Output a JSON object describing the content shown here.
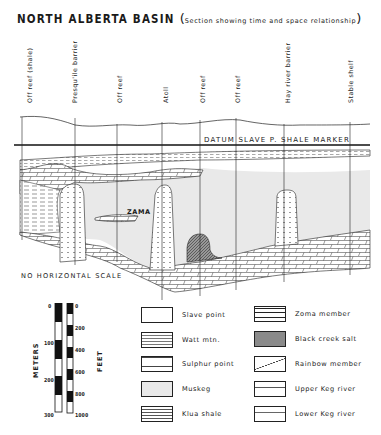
{
  "title": {
    "main": "NORTH  ALBERTA  BASIN",
    "subtitle": "Section  showing  time  and  space  relationship",
    "open_paren": "(",
    "close_paren": ")"
  },
  "wells": [
    {
      "label": "Off  reef  (shale)",
      "x": 30
    },
    {
      "label": "Presqu'ile  barrier",
      "x": 75
    },
    {
      "label": "Off  reef",
      "x": 120
    },
    {
      "label": "Atoll",
      "x": 165
    },
    {
      "label": "Off  reef",
      "x": 203
    },
    {
      "label": "Off  reef",
      "x": 238
    },
    {
      "label": "Hay  river  barrier",
      "x": 287
    },
    {
      "label": "Stable  shelf",
      "x": 350
    }
  ],
  "section": {
    "datum_label": "DATUM  SLAVE  P.  SHALE  MARKER",
    "zama_label": "ZAMA",
    "no_scale_label": "NO  HORIZONTAL  SCALE"
  },
  "scale_bar": {
    "meters_title": "METERS",
    "feet_title": "FEET",
    "meters_ticks": [
      "0",
      "100",
      "200",
      "300"
    ],
    "feet_ticks": [
      "0",
      "200",
      "400",
      "600",
      "800",
      "1000"
    ]
  },
  "legend": {
    "left": [
      {
        "label": "Slave  point",
        "pattern": "blank"
      },
      {
        "label": "Watt  mtn.",
        "pattern": "dashed"
      },
      {
        "label": "Sulphur  point",
        "pattern": "limestone"
      },
      {
        "label": "Muskeg",
        "pattern": "gray"
      },
      {
        "label": "Klua  shale",
        "pattern": "shale"
      }
    ],
    "right": [
      {
        "label": "Zoma  member",
        "pattern": "brick"
      },
      {
        "label": "Black  creek  salt",
        "pattern": "crosshatch"
      },
      {
        "label": "Rainbow  member",
        "pattern": "diagonal"
      },
      {
        "label": "Upper  Keg  river",
        "pattern": "limestone-dash"
      },
      {
        "label": "Lower  Keg  river",
        "pattern": "limestone-dot"
      }
    ]
  },
  "colors": {
    "ink": "#1a1a1a",
    "muskeg_fill": "#e9e9e9",
    "salt_fill": "#8a8a8a",
    "paper": "#ffffff"
  }
}
